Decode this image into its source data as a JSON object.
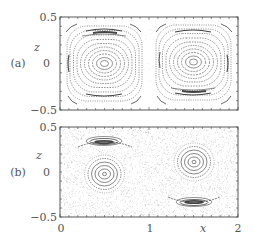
{
  "figure": {
    "panels": [
      {
        "id": "a",
        "label": "(a)",
        "ylabel": "z",
        "yticks": [
          "0.5",
          "0",
          "−0.5"
        ],
        "description": "Poincare section with two large nested vortex cells and thin resonance island chains"
      },
      {
        "id": "b",
        "label": "(b)",
        "ylabel": "z",
        "yticks": [
          "0.5",
          "0",
          "−0.5"
        ],
        "xticks": [
          "0",
          "1",
          "2"
        ],
        "xlabel": "x",
        "description": "Poincare section showing chaotic sea with two KAM vortex islands and two elongated secondary islands"
      }
    ],
    "colors": {
      "frame": "#444444",
      "contour": "#555555",
      "dots": "#9a9a9a",
      "text": "#555555"
    }
  },
  "chart_data": [
    {
      "type": "scatter",
      "title": "(a)",
      "xlabel": "",
      "ylabel": "z",
      "xlim": [
        0,
        2
      ],
      "ylim": [
        -0.5,
        0.5
      ],
      "yticks": [
        -0.5,
        0,
        0.5
      ],
      "grid": false,
      "features": [
        {
          "kind": "vortex",
          "center": [
            0.5,
            0.0
          ],
          "nested_orbits": 12
        },
        {
          "kind": "vortex",
          "center": [
            1.5,
            0.0
          ],
          "nested_orbits": 12
        },
        {
          "kind": "island",
          "center": [
            0.5,
            0.33
          ],
          "width": 0.3
        },
        {
          "kind": "island",
          "center": [
            1.5,
            -0.33
          ],
          "width": 0.3
        }
      ]
    },
    {
      "type": "scatter",
      "title": "(b)",
      "xlabel": "x",
      "ylabel": "z",
      "xlim": [
        0,
        2
      ],
      "ylim": [
        -0.5,
        0.5
      ],
      "xticks": [
        0,
        1,
        2
      ],
      "yticks": [
        -0.5,
        0,
        0.5
      ],
      "grid": false,
      "features": [
        {
          "kind": "vortex",
          "center": [
            0.5,
            -0.02
          ],
          "nested_orbits": 6
        },
        {
          "kind": "vortex",
          "center": [
            1.5,
            0.08
          ],
          "nested_orbits": 6
        },
        {
          "kind": "island",
          "center": [
            0.5,
            0.33
          ],
          "width": 0.35
        },
        {
          "kind": "island",
          "center": [
            1.5,
            -0.33
          ],
          "width": 0.35
        },
        {
          "kind": "chaotic_sea",
          "region": "remaining domain"
        }
      ]
    }
  ]
}
